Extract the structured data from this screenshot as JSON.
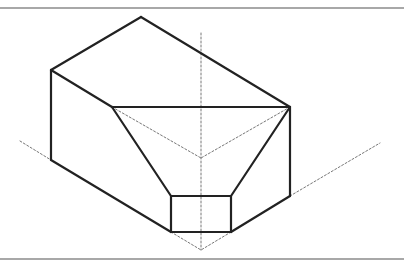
{
  "figure": {
    "colors": {
      "solid_line": "#222222",
      "dashed_line": "#777777",
      "frame_rule": "#a8a8a8",
      "background": "#ffffff"
    },
    "solid_edges": [
      [
        [
          141,
          17
        ],
        [
          51,
          70
        ]
      ],
      [
        [
          141,
          17
        ],
        [
          290,
          107
        ]
      ],
      [
        [
          51,
          70
        ],
        [
          51,
          160
        ]
      ],
      [
        [
          51,
          70
        ],
        [
          112,
          107
        ]
      ],
      [
        [
          112,
          107
        ],
        [
          290,
          107
        ]
      ],
      [
        [
          112,
          107
        ],
        [
          171,
          196
        ]
      ],
      [
        [
          290,
          107
        ],
        [
          231,
          196
        ]
      ],
      [
        [
          290,
          107
        ],
        [
          290,
          196
        ]
      ],
      [
        [
          51,
          160
        ],
        [
          171,
          232
        ]
      ],
      [
        [
          290,
          196
        ],
        [
          231,
          232
        ]
      ],
      [
        [
          171,
          196
        ],
        [
          231,
          196
        ]
      ],
      [
        [
          171,
          196
        ],
        [
          171,
          232
        ]
      ],
      [
        [
          231,
          196
        ],
        [
          231,
          232
        ]
      ],
      [
        [
          171,
          232
        ],
        [
          231,
          232
        ]
      ]
    ],
    "dashed_edges": [
      [
        [
          201,
          33
        ],
        [
          201,
          250
        ]
      ],
      [
        [
          20,
          141
        ],
        [
          51,
          160
        ]
      ],
      [
        [
          290,
          196
        ],
        [
          380,
          143
        ]
      ],
      [
        [
          112,
          107
        ],
        [
          201,
          158
        ]
      ],
      [
        [
          290,
          107
        ],
        [
          201,
          158
        ]
      ],
      [
        [
          171,
          232
        ],
        [
          201,
          250
        ]
      ],
      [
        [
          231,
          232
        ],
        [
          201,
          250
        ]
      ]
    ]
  }
}
